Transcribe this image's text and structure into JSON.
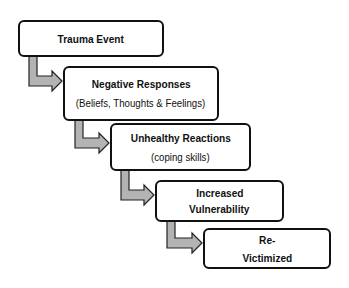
{
  "diagram": {
    "type": "flow",
    "steps": [
      {
        "title": "Trauma Event",
        "subtitle": ""
      },
      {
        "title": "Negative Responses",
        "subtitle": "(Beliefs, Thoughts & Feelings)"
      },
      {
        "title": "Unhealthy Reactions",
        "subtitle": "(coping skills)"
      },
      {
        "title": "Increased",
        "subtitle": "Vulnerability"
      },
      {
        "title": "Re-",
        "subtitle": "Victimized"
      }
    ],
    "arrow_color": "#b3b3b3"
  }
}
